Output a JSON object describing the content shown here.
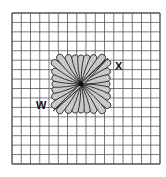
{
  "diagram": {
    "type": "needlework-stitch-grid",
    "grid": {
      "columns": 16,
      "rows": 16
    },
    "motif": {
      "name": "daisy-stitch-flower",
      "petal_color": "#c9c9c9",
      "outline_color": "#222222"
    },
    "labels": {
      "x": "X",
      "w": "W"
    },
    "colors": {
      "grid_line": "#555555",
      "background": "#ffffff"
    }
  }
}
